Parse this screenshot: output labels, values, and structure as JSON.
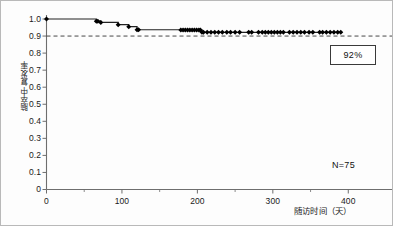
{
  "chart_data": {
    "type": "line",
    "title": "",
    "subtitle": "",
    "xlabel": "随访时间（天）",
    "ylabel": "脑卒中复发率",
    "xlim": [
      0,
      450
    ],
    "ylim": [
      0,
      1.0
    ],
    "grid": false,
    "legend": null,
    "x_ticks": [
      0,
      100,
      200,
      300,
      400
    ],
    "x_tick_labels": [
      "0",
      "100",
      "200",
      "300",
      "400"
    ],
    "y_ticks": [
      0,
      0.1,
      0.2,
      0.3,
      0.4,
      0.5,
      0.6,
      0.7,
      0.8,
      0.9,
      1.0
    ],
    "y_tick_labels": [
      "0",
      "0.1",
      "0.2",
      "0.3",
      "0.4",
      "0.5",
      "0.6",
      "0.7",
      "0.8",
      "0.9",
      "1.0"
    ],
    "series": [
      {
        "name": "生存曲线",
        "kind": "kaplan-meier-step",
        "color": "#222222",
        "steps": [
          [
            0,
            1.0
          ],
          [
            66,
            1.0
          ],
          [
            66,
            0.987
          ],
          [
            72,
            0.987
          ],
          [
            72,
            0.98
          ],
          [
            95,
            0.98
          ],
          [
            95,
            0.967
          ],
          [
            109,
            0.967
          ],
          [
            109,
            0.955
          ],
          [
            120,
            0.955
          ],
          [
            120,
            0.937
          ],
          [
            178,
            0.937
          ],
          [
            178,
            0.935
          ],
          [
            206,
            0.935
          ],
          [
            206,
            0.922
          ],
          [
            392,
            0.922
          ]
        ]
      }
    ],
    "censor_markers_x": [
      0,
      66,
      68,
      72,
      95,
      109,
      120,
      122,
      178,
      181,
      184,
      187,
      190,
      193,
      196,
      199,
      202,
      204,
      206,
      208,
      213,
      218,
      223,
      228,
      233,
      239,
      244,
      250,
      256,
      268,
      272,
      281,
      286,
      290,
      294,
      298,
      302,
      306,
      310,
      314,
      322,
      327,
      332,
      337,
      342,
      348,
      353,
      362,
      366,
      371,
      376,
      381,
      386,
      390
    ],
    "censor_marker_y": 0.922,
    "reference_line": {
      "y": 0.9,
      "style": "dashed",
      "color": "#333333",
      "spans_full_width": true
    },
    "annotations": [
      {
        "name": "survival-percent",
        "text": "92%",
        "boxed": true
      },
      {
        "name": "sample-size",
        "text": "N=75",
        "boxed": false
      }
    ]
  },
  "annotations": {
    "percent_label": "92%",
    "sample_size_label": "N=75"
  },
  "axes": {
    "x_label": "随访时间（天）",
    "y_label": "脑卒中复发率"
  },
  "colors": {
    "curve": "#222222",
    "marker": "#000000",
    "reference_line": "#333333",
    "axis": "#6e6e6e",
    "text": "#1a1a1a",
    "background": "#ffffff",
    "border": "#b9b9b9"
  }
}
